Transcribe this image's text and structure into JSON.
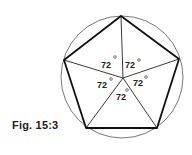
{
  "figure": {
    "caption": "Fig. 15:3",
    "shape": "regular pentagon inscribed in circle",
    "angles": [
      {
        "label": "72°",
        "value": "72",
        "x": 108,
        "y": 66
      },
      {
        "label": "72°",
        "value": "72",
        "x": 125,
        "y": 66
      },
      {
        "label": "72°",
        "value": "72",
        "x": 97,
        "y": 87
      },
      {
        "label": "72°",
        "value": "72",
        "x": 133,
        "y": 86
      },
      {
        "label": "72°",
        "value": "72",
        "x": 116,
        "y": 99
      }
    ]
  }
}
